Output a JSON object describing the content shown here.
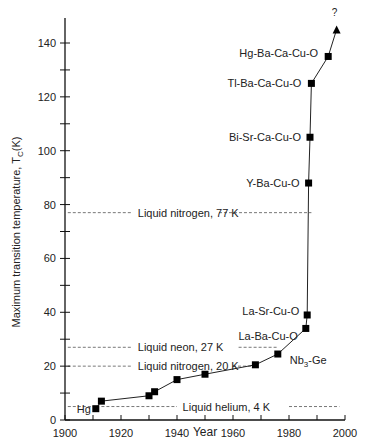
{
  "chart_data": {
    "type": "line",
    "title": "",
    "xlabel": "Year",
    "ylabel": "Maximum transition temperature, T",
    "ylabel_sub": "C",
    "ylabel_unit": "(K)",
    "xlim": [
      1900,
      2000
    ],
    "ylim": [
      0,
      150
    ],
    "x_ticks": [
      1900,
      1920,
      1940,
      1960,
      1980,
      2000
    ],
    "x_minor_step": 10,
    "y_ticks": [
      0,
      20,
      40,
      60,
      80,
      100,
      120,
      140
    ],
    "y_minor_step": 10,
    "grid": false,
    "series": [
      {
        "name": "Record Tc",
        "points": [
          {
            "x": 1911,
            "y": 4.2,
            "label": "Hg"
          },
          {
            "x": 1913,
            "y": 7,
            "label": ""
          },
          {
            "x": 1930,
            "y": 9,
            "label": ""
          },
          {
            "x": 1932,
            "y": 10.5,
            "label": ""
          },
          {
            "x": 1940,
            "y": 15,
            "label": ""
          },
          {
            "x": 1950,
            "y": 17,
            "label": ""
          },
          {
            "x": 1968,
            "y": 20.5,
            "label": ""
          },
          {
            "x": 1976,
            "y": 24.5,
            "label": "Nb3-Ge"
          },
          {
            "x": 1986,
            "y": 34,
            "label": "La-Ba-Cu-O"
          },
          {
            "x": 1986.5,
            "y": 39,
            "label": "La-Sr-Cu-O"
          },
          {
            "x": 1987,
            "y": 88,
            "label": "Y-Ba-Cu-O"
          },
          {
            "x": 1987.5,
            "y": 105,
            "label": "Bi-Sr-Ca-Cu-O"
          },
          {
            "x": 1988,
            "y": 125,
            "label": "Tl-Ba-Ca-Cu-O"
          },
          {
            "x": 1994,
            "y": 135,
            "label": "Hg-Ba-Ca-Cu-O"
          }
        ],
        "projection": {
          "x": 1997,
          "y": 145,
          "label": "?"
        }
      }
    ],
    "reference_lines": [
      {
        "label": "Liquid nitrogen, 77 K",
        "y": 77
      },
      {
        "label": "Liquid neon, 27 K",
        "y": 27
      },
      {
        "label": "Liquid nitrogen, 20 K",
        "y": 20
      },
      {
        "label": "Liquid helium, 4 K",
        "y": 5
      }
    ]
  }
}
